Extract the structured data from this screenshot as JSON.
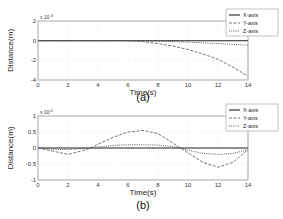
{
  "chart_data": [
    {
      "type": "line",
      "caption": "(a)",
      "xlabel": "Time(s)",
      "ylabel": "Distance(m)",
      "y_multiplier": "x 10^-3",
      "exp_base": "x 10",
      "exp_power": "-3",
      "xlim": [
        0,
        14
      ],
      "ylim": [
        -4,
        2
      ],
      "x_ticks": [
        "0",
        "2",
        "4",
        "6",
        "8",
        "10",
        "12",
        "14"
      ],
      "y_ticks": [
        "2",
        "0",
        "-2",
        "-4"
      ],
      "grid": true,
      "legend_position": "upper right",
      "legend": [
        "X-axis",
        "Y-axis",
        "Z-axis"
      ],
      "x": [
        0,
        2,
        4,
        6,
        7,
        8,
        9,
        10,
        11,
        12,
        13,
        14
      ],
      "series": [
        {
          "name": "X-axis",
          "style": "solid",
          "values": [
            0,
            0,
            0,
            0,
            0,
            0,
            0,
            0,
            0,
            0,
            0,
            0
          ]
        },
        {
          "name": "Y-axis",
          "style": "dashed",
          "values": [
            0,
            0,
            0,
            0,
            -0.1,
            -0.3,
            -0.55,
            -0.9,
            -1.35,
            -1.9,
            -2.7,
            -3.6
          ]
        },
        {
          "name": "Z-axis",
          "style": "dotted",
          "values": [
            0,
            0,
            0,
            0,
            -0.02,
            -0.05,
            -0.1,
            -0.15,
            -0.22,
            -0.3,
            -0.38,
            -0.45
          ]
        }
      ]
    },
    {
      "type": "line",
      "caption": "(b)",
      "xlabel": "Time(s)",
      "ylabel": "Distance(m)",
      "y_multiplier": "x 10^-5",
      "exp_base": "x 10",
      "exp_power": "-5",
      "xlim": [
        0,
        14
      ],
      "ylim": [
        -1,
        1
      ],
      "x_ticks": [
        "0",
        "2",
        "4",
        "6",
        "8",
        "10",
        "12",
        "14"
      ],
      "y_ticks": [
        "1",
        "0.5",
        "0",
        "-0.5",
        "-1"
      ],
      "grid": true,
      "legend_position": "upper right",
      "legend": [
        "X-axis",
        "Y-axis",
        "Z-axis"
      ],
      "x": [
        0,
        1,
        2,
        3,
        3.5,
        4,
        5,
        6,
        7,
        8,
        9,
        9.5,
        10,
        11,
        12,
        13,
        14
      ],
      "series": [
        {
          "name": "X-axis",
          "style": "solid",
          "values": [
            0,
            0,
            0,
            0,
            0,
            0,
            0,
            0,
            0,
            0,
            0,
            0,
            0,
            0,
            0,
            0,
            0
          ]
        },
        {
          "name": "Y-axis",
          "style": "dashed",
          "values": [
            0,
            -0.1,
            -0.2,
            -0.08,
            0,
            0.12,
            0.33,
            0.5,
            0.55,
            0.45,
            0.15,
            0,
            -0.15,
            -0.45,
            -0.6,
            -0.45,
            -0.05
          ]
        },
        {
          "name": "Z-axis",
          "style": "dotted",
          "values": [
            0,
            -0.04,
            -0.05,
            -0.02,
            0,
            0.03,
            0.08,
            0.1,
            0.1,
            0.09,
            0.04,
            0,
            -0.07,
            -0.17,
            -0.2,
            -0.17,
            -0.05
          ]
        }
      ]
    }
  ]
}
